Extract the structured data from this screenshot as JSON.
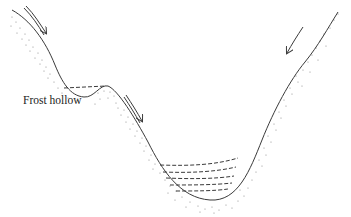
{
  "diagram": {
    "labels": {
      "frost_hollow": "Frost hollow"
    },
    "elements": {
      "ground_profile": "solid line valley cross-section",
      "soil_stipple": "dotted subsurface shading",
      "arrows": [
        {
          "id": "arrow-upper-left-slope",
          "direction": "downslope"
        },
        {
          "id": "arrow-mid-slope",
          "direction": "downslope"
        },
        {
          "id": "arrow-right-slope",
          "direction": "downslope"
        }
      ],
      "cold_air_pools": [
        {
          "id": "frost-hollow-pool",
          "layers": 1
        },
        {
          "id": "valley-floor-pool",
          "layers": 5
        }
      ]
    },
    "colors": {
      "line": "#3a3a3a",
      "stipple": "#8a8a8a",
      "background": "#ffffff"
    }
  }
}
